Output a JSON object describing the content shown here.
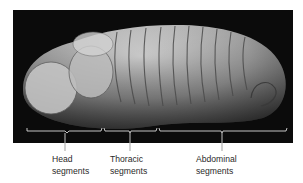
{
  "figure": {
    "colors": {
      "panel_background": "#0b0b0b",
      "specimen": "#b9b9b9",
      "bracket": "#d8d8d8",
      "label_text": "#2a2a2a"
    },
    "labels": [
      {
        "id": "head",
        "line1": "Head",
        "line2": "segments"
      },
      {
        "id": "thoracic",
        "line1": "Thoracic",
        "line2": "segments"
      },
      {
        "id": "abdominal",
        "line1": "Abdominal",
        "line2": "segments"
      }
    ]
  }
}
